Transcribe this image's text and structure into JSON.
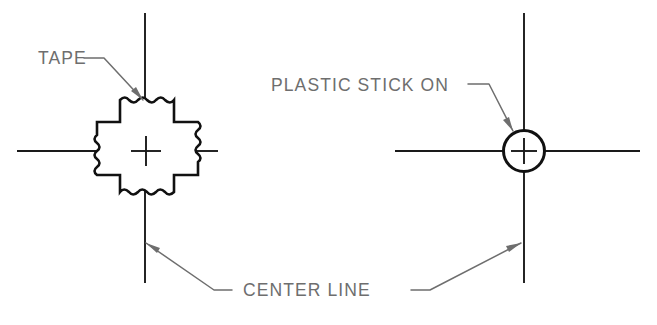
{
  "drawing": {
    "title": "Tape and plastic stick-on center line markers",
    "background_color": "#ffffff",
    "line_color": "#111111",
    "annotation_color": "#6e6e6e",
    "width": 657,
    "height": 325
  },
  "labels": {
    "tape": "TAPE",
    "plastic_stick_on": "PLASTIC STICK ON",
    "center_line": "CENTER LINE"
  },
  "views": [
    {
      "id": "left-view",
      "name": "tape-marker-view",
      "marker_type": "tape",
      "center_x": 146,
      "center_y": 151,
      "vertical_centerline": {
        "x": 145,
        "y1": 13,
        "y2": 283
      },
      "horizontal_centerline": {
        "y": 151,
        "x1": 17,
        "x2": 218
      }
    },
    {
      "id": "right-view",
      "name": "plastic-stick-on-marker-view",
      "marker_type": "plastic-stick-on",
      "center_x": 524,
      "center_y": 151,
      "radius": 21,
      "vertical_centerline": {
        "x": 524,
        "y1": 13,
        "y2": 283
      },
      "horizontal_centerline": {
        "y": 151,
        "x1": 395,
        "x2": 640
      }
    }
  ],
  "annotations": [
    {
      "name": "tape-leader",
      "target": "tape-cross-top-edge",
      "label": "TAPE"
    },
    {
      "name": "plastic-stick-on-leader",
      "target": "plastic-circle",
      "label": "PLASTIC STICK ON"
    },
    {
      "name": "center-line-leader-left",
      "target": "left-vertical-centerline",
      "label": "CENTER LINE"
    },
    {
      "name": "center-line-leader-right",
      "target": "right-vertical-centerline",
      "label": "CENTER LINE"
    }
  ]
}
